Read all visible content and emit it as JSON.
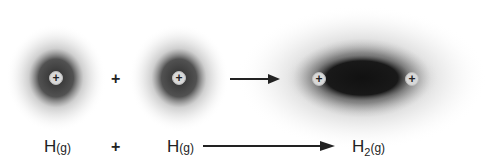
{
  "diagram": {
    "atom1": {
      "nucleus": "+"
    },
    "atom2": {
      "nucleus": "+"
    },
    "molecule": {
      "nuclei": [
        "+",
        "+"
      ]
    },
    "top_plus": "+",
    "equation": {
      "reactant1": {
        "element": "H",
        "state": "(g)"
      },
      "plus": "+",
      "reactant2": {
        "element": "H",
        "state": "(g)"
      },
      "product": {
        "element": "H",
        "subscript": "2",
        "state": "(g)"
      }
    },
    "colors": {
      "dark": "#1a1a1a",
      "stipple": "#555555",
      "nucleus_fill": "#d8d8d8"
    }
  }
}
